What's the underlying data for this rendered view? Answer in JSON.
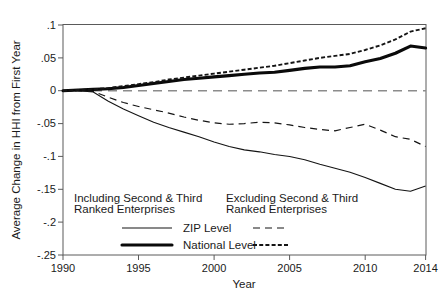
{
  "chart_data": {
    "type": "line",
    "title": "",
    "xlabel": "Year",
    "ylabel": "Average Change in HHI from First Year",
    "xlim": [
      1990,
      2014
    ],
    "ylim": [
      -0.25,
      0.1
    ],
    "grid": false,
    "legend_position": "inside-bottom",
    "xticks": [
      "1990",
      "1995",
      "2000",
      "2005",
      "2010",
      "2014"
    ],
    "xtick_values": [
      1990,
      1995,
      2000,
      2005,
      2010,
      2014
    ],
    "yticks": [
      ".1",
      ".05",
      "0",
      "-.05",
      "-.1",
      "-.15",
      "-.2",
      "-.25"
    ],
    "ytick_values": [
      0.1,
      0.05,
      0,
      -0.05,
      -0.1,
      -0.15,
      -0.2,
      -0.25
    ],
    "x": [
      1990,
      1991,
      1992,
      1993,
      1994,
      1995,
      1996,
      1997,
      1998,
      1999,
      2000,
      2001,
      2002,
      2003,
      2004,
      2005,
      2006,
      2007,
      2008,
      2009,
      2010,
      2011,
      2012,
      2013,
      2014
    ],
    "series": [
      {
        "name": "National Level — Excluding Second & Third Ranked Enterprises",
        "style": "dotted-thick",
        "values": [
          0.0,
          0.001,
          0.002,
          0.004,
          0.007,
          0.01,
          0.013,
          0.017,
          0.02,
          0.023,
          0.026,
          0.029,
          0.032,
          0.035,
          0.038,
          0.042,
          0.046,
          0.05,
          0.053,
          0.056,
          0.062,
          0.069,
          0.078,
          0.09,
          0.095
        ]
      },
      {
        "name": "National Level — Including Second & Third Ranked Enterprises",
        "style": "solid-thick",
        "values": [
          0.0,
          0.001,
          0.002,
          0.003,
          0.005,
          0.008,
          0.011,
          0.014,
          0.017,
          0.019,
          0.021,
          0.023,
          0.025,
          0.027,
          0.028,
          0.031,
          0.034,
          0.036,
          0.036,
          0.038,
          0.044,
          0.049,
          0.057,
          0.068,
          0.065
        ]
      },
      {
        "name": "ZIP Level — Excluding Second & Third Ranked Enterprises",
        "style": "dashed-thin",
        "values": [
          0.0,
          0.0,
          -0.001,
          -0.01,
          -0.018,
          -0.024,
          -0.029,
          -0.034,
          -0.04,
          -0.045,
          -0.049,
          -0.051,
          -0.05,
          -0.048,
          -0.049,
          -0.052,
          -0.056,
          -0.059,
          -0.061,
          -0.056,
          -0.051,
          -0.06,
          -0.07,
          -0.074,
          -0.085
        ]
      },
      {
        "name": "ZIP Level — Including Second & Third Ranked Enterprises",
        "style": "solid-thin",
        "values": [
          0.0,
          0.0,
          -0.002,
          -0.016,
          -0.028,
          -0.038,
          -0.048,
          -0.056,
          -0.063,
          -0.07,
          -0.078,
          -0.085,
          -0.09,
          -0.093,
          -0.097,
          -0.1,
          -0.105,
          -0.112,
          -0.118,
          -0.124,
          -0.132,
          -0.141,
          -0.15,
          -0.153,
          -0.145
        ]
      },
      {
        "name": "Zero Reference",
        "style": "dashed-gray",
        "values": [
          0,
          0,
          0,
          0,
          0,
          0,
          0,
          0,
          0,
          0,
          0,
          0,
          0,
          0,
          0,
          0,
          0,
          0,
          0,
          0,
          0,
          0,
          0,
          0,
          0
        ]
      }
    ]
  },
  "legend": {
    "heading_left_line1": "Including Second & Third",
    "heading_left_line2": "Ranked Enterprises",
    "heading_right_line1": "Excluding Second & Third",
    "heading_right_line2": "Ranked Enterprises",
    "row1_label": "ZIP Level",
    "row2_label": "National Level"
  },
  "colors": {
    "line": "#141414",
    "frame": "#5a5a5a",
    "zero_reference": "#8c8c8c",
    "background": "#ffffff"
  }
}
